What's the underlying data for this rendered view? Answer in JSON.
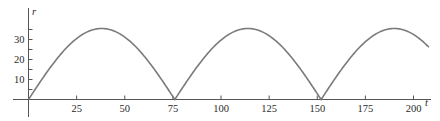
{
  "chart_data": {
    "type": "line",
    "title": "",
    "xlabel": "t",
    "ylabel": "r",
    "xlim": [
      -8,
      209
    ],
    "ylim": [
      -8,
      46
    ],
    "grid": false,
    "legend": null,
    "x_ticks": [
      25,
      50,
      75,
      100,
      125,
      150,
      175,
      200
    ],
    "x_tick_labels": [
      "25",
      "50",
      "75",
      "100",
      "125",
      "150",
      "175",
      "200"
    ],
    "y_ticks_minor": [
      5,
      10,
      15,
      20,
      25,
      30,
      35
    ],
    "y_tick_labels": [
      {
        "value": 10,
        "label": "10"
      },
      {
        "value": 20,
        "label": "20"
      },
      {
        "value": 30,
        "label": "30"
      }
    ],
    "series": [
      {
        "name": "r(t)",
        "color": "#7a7a7a",
        "x": [
          0,
          4,
          8,
          12,
          16,
          20,
          24,
          28,
          32,
          38,
          44,
          48,
          52,
          56,
          60,
          64,
          68,
          72,
          76,
          80,
          84,
          88,
          92,
          96,
          100,
          104,
          108,
          114,
          120,
          124,
          128,
          132,
          136,
          140,
          144,
          148,
          152,
          156,
          160,
          164,
          168,
          172,
          176,
          180,
          184,
          190,
          196,
          200,
          204,
          208
        ],
        "y": [
          0,
          5.8,
          11.5,
          16.8,
          21.5,
          25.9,
          29.4,
          32.2,
          34.2,
          35.5,
          34.2,
          32.2,
          29.4,
          25.9,
          21.5,
          16.8,
          11.5,
          5.8,
          0,
          5.8,
          11.5,
          16.8,
          21.5,
          25.9,
          29.4,
          32.2,
          34.2,
          35.5,
          34.2,
          32.2,
          29.4,
          25.9,
          21.5,
          16.8,
          11.5,
          5.8,
          0,
          5.8,
          11.5,
          16.8,
          21.5,
          25.9,
          29.4,
          32.2,
          34.2,
          35.5,
          34.2,
          32.2,
          29.4,
          25.9
        ]
      }
    ]
  },
  "axes": {
    "x_label": "t",
    "y_label": "r"
  }
}
